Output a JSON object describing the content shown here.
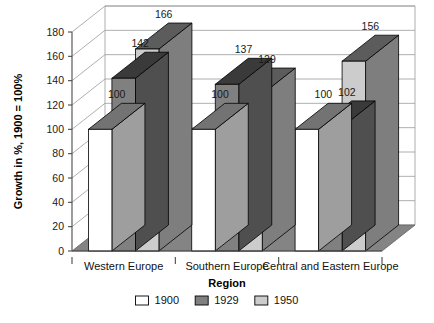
{
  "chart_data": {
    "type": "bar",
    "title": "",
    "subtitle": "",
    "xlabel": "Region",
    "ylabel": "Growth in %, 1900 = 100%",
    "categories": [
      "Western Europe",
      "Southern Europe",
      "Central and Eastern Europe"
    ],
    "series": [
      {
        "name": "1900",
        "values": [
          100,
          100,
          100
        ],
        "color": "#ffffff"
      },
      {
        "name": "1929",
        "values": [
          142,
          137,
          102
        ],
        "color": "#808080"
      },
      {
        "name": "1950",
        "values": [
          166,
          129,
          156
        ],
        "color": "#cccccc"
      }
    ],
    "ylim": [
      0,
      180
    ],
    "yticks": [
      0,
      20,
      40,
      60,
      80,
      100,
      120,
      140,
      160,
      180
    ],
    "ytick_labels": [
      "0",
      "20",
      "40",
      "60",
      "80",
      "100",
      "120",
      "140",
      "160",
      "180"
    ],
    "grid": true,
    "grid_axis": "y",
    "legend_position": "bottom",
    "style": "3d-column",
    "data_labels": true,
    "data_label_values": [
      [
        "100",
        "142",
        "166"
      ],
      [
        "100",
        "137",
        "129"
      ],
      [
        "100",
        "102",
        "156"
      ]
    ]
  },
  "legend": {
    "items": [
      {
        "label": "1900",
        "swatch": "#ffffff"
      },
      {
        "label": "1929",
        "swatch": "#808080"
      },
      {
        "label": "1950",
        "swatch": "#cccccc"
      }
    ]
  },
  "axes": {
    "y_title": "Growth in %, 1900 = 100%",
    "x_title": "Region",
    "y_ticks": [
      "180",
      "160",
      "140",
      "120",
      "100",
      "80",
      "60",
      "40",
      "20",
      "0"
    ],
    "x_categories": [
      "Western Europe",
      "Southern Europe",
      "Central and Eastern Europe"
    ]
  },
  "colors": {
    "bar_1900_front": "#ffffff",
    "bar_1929_front": "#808080",
    "bar_1950_front": "#cccccc",
    "floor": "#848484",
    "wall": "#ffffff",
    "grid_line": "#9a9a9a",
    "outline": "#000000"
  }
}
